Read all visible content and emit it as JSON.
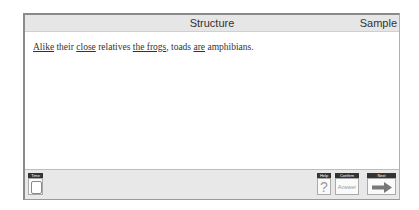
{
  "header": {
    "title": "Structure",
    "right_label": "Sample"
  },
  "question": {
    "segments": [
      {
        "text": "Alike",
        "underlined": true
      },
      {
        "text": " their ",
        "underlined": false
      },
      {
        "text": "close",
        "underlined": true
      },
      {
        "text": " relatives ",
        "underlined": false
      },
      {
        "text": "the frogs",
        "underlined": true
      },
      {
        "text": ", toads ",
        "underlined": false
      },
      {
        "text": "are",
        "underlined": true
      },
      {
        "text": " amphibians.",
        "underlined": false
      }
    ]
  },
  "footer": {
    "time": {
      "label": "Time",
      "icon": "clock-icon"
    },
    "help": {
      "label": "Help",
      "glyph": "?",
      "icon": "question-icon"
    },
    "confirm": {
      "label": "Confirm",
      "text": "Answer"
    },
    "next": {
      "label": "Next",
      "icon": "arrow-right-icon"
    }
  }
}
